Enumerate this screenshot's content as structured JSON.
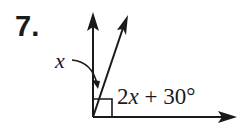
{
  "problem": {
    "number": "7.",
    "angle_x_label": "x",
    "angle_expression": {
      "coefficient": "2",
      "variable": "x",
      "rest": " + 30°"
    },
    "description": "Right angle at vertex split by a ray into angles x and 2x + 30°"
  },
  "colors": {
    "ink": "#1a1a1a",
    "background": "#ffffff"
  }
}
